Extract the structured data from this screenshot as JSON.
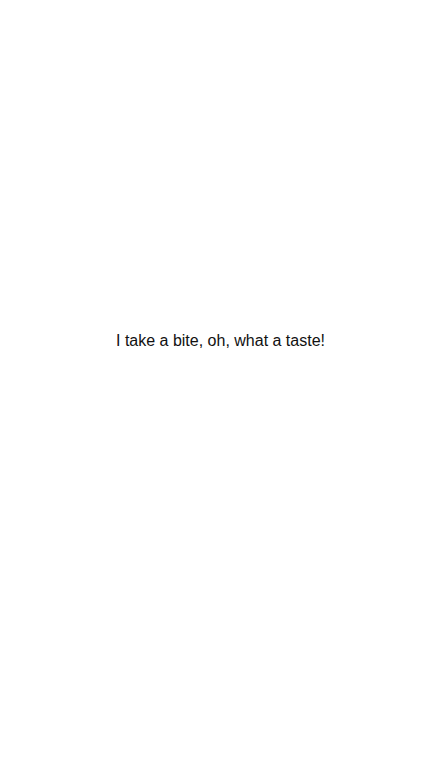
{
  "screen": {
    "background_color": "#ffffff",
    "caption": {
      "text": "I take a bite, oh, what a taste!",
      "color": "#111111"
    }
  }
}
